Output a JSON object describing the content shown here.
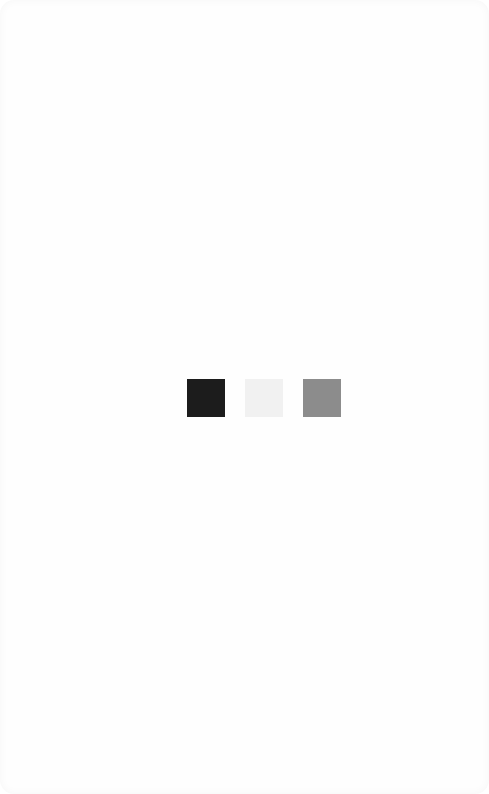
{
  "screen": {
    "background": "#fefefe"
  },
  "loader": {
    "squares": [
      {
        "name": "dark",
        "color": "#1c1c1c"
      },
      {
        "name": "light",
        "color": "#f1f1f1"
      },
      {
        "name": "gray",
        "color": "#8c8c8c"
      }
    ]
  }
}
